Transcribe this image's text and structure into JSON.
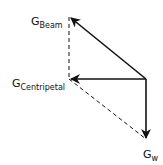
{
  "diagram": {
    "type": "vector-force-diagram",
    "stroke_color": "#111111",
    "background": "#ffffff",
    "origin": {
      "x": 146,
      "y": 79
    },
    "vectors": [
      {
        "id": "beam",
        "label_main": "G",
        "label_sub": "Beam",
        "tip": {
          "x": 70,
          "y": 17
        },
        "style": "solid"
      },
      {
        "id": "centripetal",
        "label_main": "G",
        "label_sub": "Centripetal",
        "tip": {
          "x": 70,
          "y": 79
        },
        "style": "solid"
      },
      {
        "id": "weight",
        "label_main": "G",
        "label_sub": "w",
        "tip": {
          "x": 146,
          "y": 139
        },
        "style": "solid"
      }
    ],
    "construction_lines": [
      {
        "from": {
          "x": 69,
          "y": 17
        },
        "to": {
          "x": 69,
          "y": 79
        },
        "style": "dashed"
      },
      {
        "from": {
          "x": 69,
          "y": 79
        },
        "to": {
          "x": 146,
          "y": 139
        },
        "style": "dashed"
      }
    ]
  },
  "labels": {
    "beam": {
      "main": "G",
      "sub": "Beam"
    },
    "centripetal": {
      "main": "G",
      "sub": "Centripetal"
    },
    "weight": {
      "main": "G",
      "sub": "w"
    }
  }
}
